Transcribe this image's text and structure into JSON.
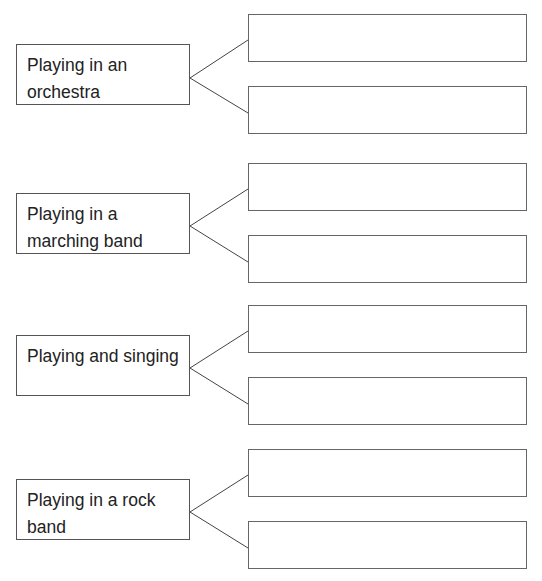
{
  "worksheet": {
    "groups": [
      {
        "label": "Playing in an orchestra",
        "top": 44,
        "answers": [
          {
            "top": 14,
            "value": ""
          },
          {
            "top": 86,
            "value": ""
          }
        ]
      },
      {
        "label": "Playing in a marching band",
        "top": 193,
        "answers": [
          {
            "top": 163,
            "value": ""
          },
          {
            "top": 235,
            "value": ""
          }
        ]
      },
      {
        "label": "Playing and singing",
        "top": 335,
        "answers": [
          {
            "top": 305,
            "value": ""
          },
          {
            "top": 377,
            "value": ""
          }
        ]
      },
      {
        "label": "Playing in a rock band",
        "top": 479,
        "answers": [
          {
            "top": 449,
            "value": ""
          },
          {
            "top": 521,
            "value": ""
          }
        ]
      }
    ]
  }
}
